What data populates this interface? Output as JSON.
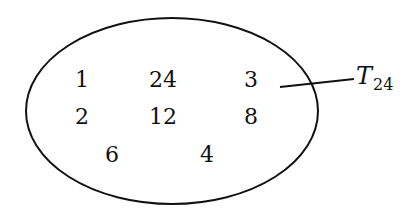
{
  "diagram": {
    "type": "set-ellipse",
    "set_label": {
      "symbol": "T",
      "subscript": "24"
    },
    "elements": [
      {
        "value": "1",
        "x": 82,
        "y": 80
      },
      {
        "value": "24",
        "x": 163,
        "y": 80
      },
      {
        "value": "3",
        "x": 251,
        "y": 80
      },
      {
        "value": "2",
        "x": 82,
        "y": 117
      },
      {
        "value": "12",
        "x": 163,
        "y": 117
      },
      {
        "value": "8",
        "x": 251,
        "y": 117
      },
      {
        "value": "6",
        "x": 112,
        "y": 155
      },
      {
        "value": "4",
        "x": 207,
        "y": 155
      }
    ]
  }
}
